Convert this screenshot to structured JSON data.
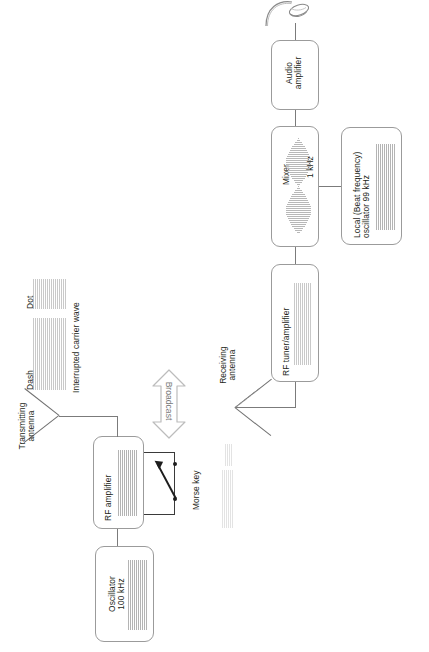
{
  "diagram": {
    "colors": {
      "box_border": "#9b9b9b",
      "line": "#7b7b7b",
      "text": "#231f20",
      "waveform": "#c9c9c9",
      "faint_waveform": "#e3e3e3",
      "broadcast_arrow": "#b0b0b0",
      "morse_key": "#1d1d1d"
    },
    "transmitter": {
      "blocks": [
        {
          "id": "oscillator",
          "label": "Oscillator\n100 kHz",
          "waveform": "continuous-carrier"
        },
        {
          "id": "rf-amplifier",
          "label": "RF amplifier",
          "waveform": "continuous-carrier"
        }
      ],
      "morse_key_label": "Morse key",
      "antenna_label": "Transmitting\nantenna",
      "signal_labels": {
        "dot": "Dot",
        "dash": "Dash",
        "carrier": "Interrupted carrier wave"
      }
    },
    "broadcast": {
      "label": "Broadcast"
    },
    "receiver": {
      "antenna_label": "Receiving\nantenna",
      "blocks": [
        {
          "id": "rf-tuner",
          "label": "RF tuner/amplifier",
          "waveform": "weak-carrier"
        },
        {
          "id": "mixer",
          "label": "Mixer",
          "waveform": "beat-envelope"
        },
        {
          "id": "local-osc",
          "label": "Local (Beat frequency)\noscillator 99 kHz",
          "waveform": "continuous-carrier"
        },
        {
          "id": "audio-amp",
          "label": "Audio\namplifier",
          "waveform": "none"
        }
      ],
      "beat_label": "1 kHz",
      "output_device": "headphones"
    }
  }
}
